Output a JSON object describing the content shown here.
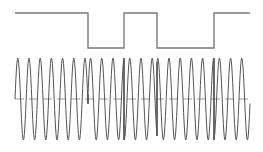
{
  "figure": {
    "name": "bpsk-modulation-waveform",
    "width": 263,
    "height": 152,
    "background_color": "#ffffff"
  },
  "chart_data": {
    "type": "line",
    "title": "",
    "subtitle": "",
    "xlabel": "",
    "ylabel": "",
    "grid": false,
    "legend": null,
    "axis_visible": false,
    "tick_labels": [],
    "annotations": [],
    "xlim": [
      0,
      263
    ],
    "ylim": [
      0,
      152
    ],
    "series": [
      {
        "name": "digital-data-signal",
        "kind": "square",
        "color": "#7a7a7a",
        "line_width": 1.4,
        "x_start": 15,
        "x_end": 250,
        "high_y": 13,
        "low_y": 48,
        "initial_level": "high",
        "transitions": [
          88,
          124,
          157,
          214
        ],
        "bit_sequence": [
          1,
          0,
          1,
          0,
          1
        ],
        "segments": [
          {
            "x0": 15,
            "x1": 88,
            "level": "high",
            "bit": 1
          },
          {
            "x0": 88,
            "x1": 124,
            "level": "low",
            "bit": 0
          },
          {
            "x0": 124,
            "x1": 157,
            "level": "high",
            "bit": 1
          },
          {
            "x0": 157,
            "x1": 214,
            "level": "low",
            "bit": 0
          },
          {
            "x0": 214,
            "x1": 250,
            "level": "high",
            "bit": 1
          }
        ]
      },
      {
        "name": "bpsk-modulated-carrier",
        "kind": "sine-phase-shift-keyed",
        "color": "#555555",
        "line_width": 1.0,
        "x_start": 15,
        "x_end": 250,
        "center_y": 99,
        "amplitude": 41,
        "peak_y": 58,
        "trough_y": 140,
        "period_px": 11.2,
        "phase_offset_deg": 0,
        "phase_reversals": [
          88,
          124,
          157,
          214
        ],
        "cycles_total": 21,
        "samples_per_period": 24
      },
      {
        "name": "carrier-center-baseline",
        "kind": "dashed-horizontal",
        "color": "#8c8c8c",
        "line_width": 0.9,
        "y": 99,
        "x_start": 15,
        "x_end": 250,
        "dash_pattern": [
          9,
          5
        ]
      }
    ]
  }
}
